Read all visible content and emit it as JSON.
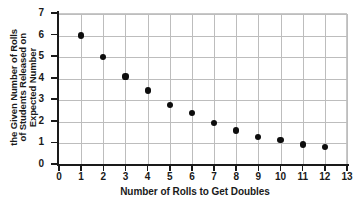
{
  "chart_data": {
    "type": "scatter",
    "title": "",
    "xlabel": "Number of Rolls to Get Doubles",
    "ylabel_lines": [
      "Expected Number",
      "of Students Released on",
      "the Given Number of Rolls"
    ],
    "ylabel": "Expected Number of Students Released on the Given Number of Rolls",
    "xlim": [
      0,
      13
    ],
    "ylim": [
      0,
      7
    ],
    "xticks": [
      0,
      1,
      2,
      3,
      4,
      5,
      6,
      7,
      8,
      9,
      10,
      11,
      12,
      13
    ],
    "yticks": [
      0,
      1,
      2,
      3,
      4,
      5,
      6,
      7
    ],
    "xtick_labels": [
      "0",
      "1",
      "2",
      "3",
      "4",
      "5",
      "6",
      "7",
      "8",
      "9",
      "10",
      "11",
      "12",
      "13"
    ],
    "ytick_labels": [
      "0",
      "1",
      "2",
      "3",
      "4",
      "5",
      "6",
      "7"
    ],
    "grid": true,
    "legend": "none",
    "marker_color": "#0d0d0d",
    "grid_color": "#bdbdbd",
    "axis_color": "#1a1a1a",
    "background": "#ffffff",
    "x": [
      1,
      2,
      3,
      4,
      5,
      6,
      7,
      8,
      9,
      10,
      11,
      12
    ],
    "values": [
      6.0,
      5.0,
      4.1,
      3.45,
      2.8,
      2.4,
      1.95,
      1.6,
      1.3,
      1.15,
      0.95,
      0.85
    ],
    "points": [
      {
        "x": 1,
        "y": 6.0
      },
      {
        "x": 2,
        "y": 5.0
      },
      {
        "x": 3,
        "y": 4.1
      },
      {
        "x": 4,
        "y": 3.45
      },
      {
        "x": 5,
        "y": 2.8
      },
      {
        "x": 6,
        "y": 2.4
      },
      {
        "x": 7,
        "y": 1.95
      },
      {
        "x": 8,
        "y": 1.6
      },
      {
        "x": 9,
        "y": 1.3
      },
      {
        "x": 10,
        "y": 1.15
      },
      {
        "x": 11,
        "y": 0.95
      },
      {
        "x": 12,
        "y": 0.85
      }
    ]
  }
}
